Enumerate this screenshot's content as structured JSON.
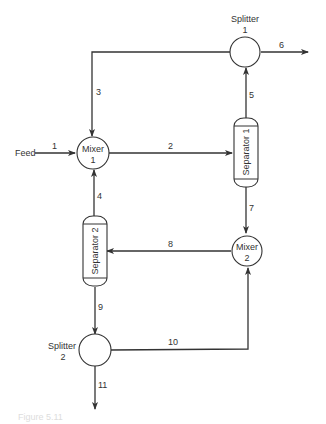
{
  "diagram": {
    "type": "process-flow",
    "units": {
      "splitter1": {
        "line1": "Splitter",
        "line2": "1"
      },
      "mixer1": {
        "line1": "Mixer",
        "line2": "1"
      },
      "separator1": {
        "label": "Separator 1"
      },
      "separator2": {
        "label": "Separator 2"
      },
      "mixer2": {
        "line1": "Mixer",
        "line2": "2"
      },
      "splitter2": {
        "line1": "Splitter",
        "line2": "2"
      }
    },
    "feed_label": "Feed",
    "streams": [
      {
        "id": "1",
        "from": "Feed",
        "to": "Mixer 1"
      },
      {
        "id": "2",
        "from": "Mixer 1",
        "to": "Separator 1"
      },
      {
        "id": "3",
        "from": "Splitter 1",
        "to": "Mixer 1"
      },
      {
        "id": "4",
        "from": "Separator 2",
        "to": "Mixer 1"
      },
      {
        "id": "5",
        "from": "Separator 1",
        "to": "Splitter 1"
      },
      {
        "id": "6",
        "from": "Splitter 1",
        "to": "Product"
      },
      {
        "id": "7",
        "from": "Separator 1",
        "to": "Mixer 2"
      },
      {
        "id": "8",
        "from": "Mixer 2",
        "to": "Separator 2"
      },
      {
        "id": "9",
        "from": "Separator 2",
        "to": "Splitter 2"
      },
      {
        "id": "10",
        "from": "Splitter 2",
        "to": "Mixer 2"
      },
      {
        "id": "11",
        "from": "Splitter 2",
        "to": "Product"
      }
    ],
    "caption": "Figure 5.11"
  }
}
